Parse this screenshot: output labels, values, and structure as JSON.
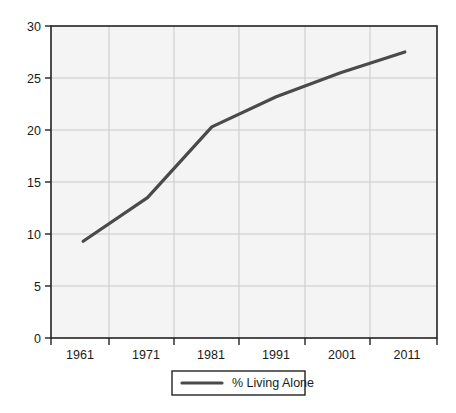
{
  "chart_data": {
    "type": "line",
    "title": "",
    "subtitle": "",
    "xlabel": "",
    "ylabel": "",
    "x": [
      "1961",
      "1971",
      "1981",
      "1991",
      "2001",
      "2011"
    ],
    "categories": [
      "1961",
      "1971",
      "1981",
      "1991",
      "2001",
      "2011"
    ],
    "series": [
      {
        "name": "% Living Alone",
        "values": [
          9.3,
          13.5,
          20.3,
          23.2,
          25.5,
          27.5
        ],
        "color": "#4a4a4a"
      }
    ],
    "ylim": [
      0,
      30
    ],
    "y_ticks": [
      0,
      5,
      10,
      15,
      20,
      25,
      30
    ],
    "y_tick_labels": [
      "0",
      "5",
      "10",
      "15",
      "20",
      "25",
      "30"
    ],
    "x_tick_labels": [
      "1961",
      "1971",
      "1981",
      "1991",
      "2001",
      "2011"
    ],
    "grid": true,
    "grid_color": "#c9c9c9",
    "legend_position": "bottom",
    "legend_entries": [
      "% Living Alone"
    ],
    "plot_background": "#f4f4f4",
    "axis_color": "#222222"
  },
  "axes": {
    "y_labels": [
      "30",
      "25",
      "20",
      "15",
      "10",
      "5",
      "0"
    ],
    "x_labels": [
      "1961",
      "1971",
      "1981",
      "1991",
      "2001",
      "2011"
    ]
  },
  "legend": {
    "items": [
      {
        "label": "% Living Alone",
        "swatch_color": "#4a4a4a"
      }
    ]
  }
}
